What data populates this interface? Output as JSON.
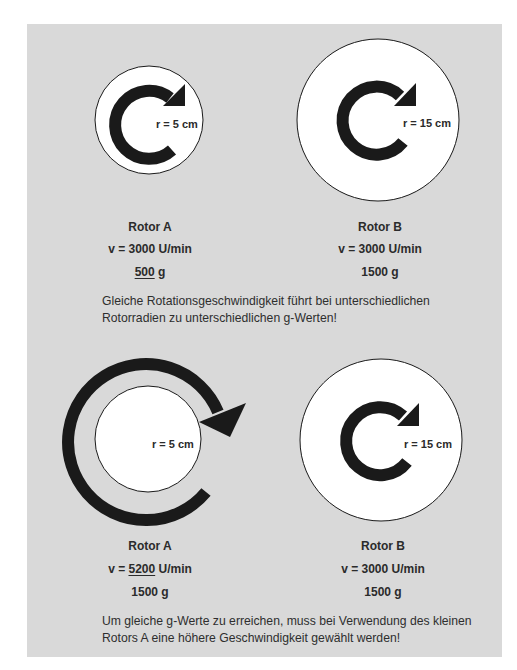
{
  "colors": {
    "panel_bg": "#d9d9d9",
    "disc_fill": "#ffffff",
    "arrow": "#1a1a1a",
    "text": "#2b2b2b"
  },
  "top_section": {
    "rotor_a": {
      "radius_label": "r = 5 cm",
      "name": "Rotor A",
      "speed_prefix": "v = ",
      "speed_value": "3000",
      "speed_unit": " U/min",
      "g_value": "500",
      "g_unit": " g",
      "emphasized": "g_value"
    },
    "rotor_b": {
      "radius_label": "r = 15 cm",
      "name": "Rotor B",
      "speed_prefix": "v = ",
      "speed_value": "3000",
      "speed_unit": " U/min",
      "g_value": "1500",
      "g_unit": " g"
    },
    "caption_line1": "Gleiche Rotationsgeschwindigkeit führt bei unterschiedlichen",
    "caption_line2": "Rotorradien zu unterschiedlichen g-Werten!"
  },
  "bottom_section": {
    "rotor_a": {
      "radius_label": "r = 5 cm",
      "name": "Rotor A",
      "speed_prefix": "v = ",
      "speed_value": "5200",
      "speed_unit": " U/min",
      "g_value": "1500",
      "g_unit": " g",
      "emphasized": "speed_value"
    },
    "rotor_b": {
      "radius_label": "r = 15 cm",
      "name": "Rotor B",
      "speed_prefix": "v = ",
      "speed_value": "3000",
      "speed_unit": " U/min",
      "g_value": "1500",
      "g_unit": " g"
    },
    "caption_line1": "Um gleiche g-Werte zu erreichen, muss bei Verwendung des kleinen",
    "caption_line2": "Rotors A eine höhere Geschwindigkeit gewählt werden!"
  }
}
